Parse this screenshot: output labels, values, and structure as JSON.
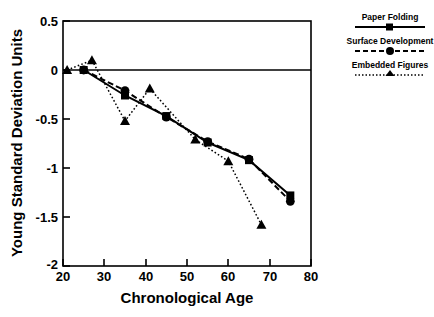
{
  "chart_data": {
    "type": "line",
    "title": "",
    "xlabel": "Chronological Age",
    "ylabel": "Young Standard Deviation Units",
    "xlim": [
      20,
      80
    ],
    "ylim": [
      -2,
      0.5
    ],
    "xticks": [
      20,
      30,
      40,
      50,
      60,
      70,
      80
    ],
    "xtick_labels": [
      "20",
      "30",
      "40",
      "50",
      "60",
      "70",
      "80"
    ],
    "yticks": [
      0.5,
      0,
      -0.5,
      -1,
      -1.5,
      -2
    ],
    "ytick_labels": [
      "0.5",
      "0",
      "-0.5",
      "-1",
      "-1.5",
      "-2"
    ],
    "grid": false,
    "zero_line": true,
    "legend_position": "outside-right-top",
    "series": [
      {
        "name": "Paper Folding",
        "marker": "square",
        "linestyle": "solid",
        "color": "#000000",
        "x": [
          25,
          35,
          45,
          55,
          65,
          75
        ],
        "y": [
          0.0,
          -0.26,
          -0.47,
          -0.74,
          -0.92,
          -1.28
        ]
      },
      {
        "name": "Surface Development",
        "marker": "circle",
        "linestyle": "dashed",
        "color": "#000000",
        "x": [
          25,
          35,
          45,
          55,
          65,
          75
        ],
        "y": [
          0.0,
          -0.21,
          -0.48,
          -0.73,
          -0.91,
          -1.34
        ]
      },
      {
        "name": "Embedded Figures",
        "marker": "triangle",
        "linestyle": "dotted",
        "color": "#000000",
        "x": [
          21,
          27,
          35,
          41,
          52,
          60,
          68
        ],
        "y": [
          0.0,
          0.1,
          -0.52,
          -0.19,
          -0.71,
          -0.93,
          -1.58
        ]
      }
    ]
  },
  "axes": {
    "x_title": "Chronological Age",
    "y_title": "Young Standard Deviation Units",
    "x_tick_labels": [
      "20",
      "30",
      "40",
      "50",
      "60",
      "70",
      "80"
    ],
    "y_tick_labels": [
      "0.5",
      "0",
      "-0.5",
      "-1",
      "-1.5",
      "-2"
    ]
  },
  "legend": {
    "entries": [
      {
        "label": "Paper Folding",
        "marker": "square-marker",
        "line": "solid-line"
      },
      {
        "label": "Surface Development",
        "marker": "circle-marker",
        "line": "dashed-line"
      },
      {
        "label": "Embedded Figures",
        "marker": "triangle-marker",
        "line": "dotted-line"
      }
    ]
  }
}
